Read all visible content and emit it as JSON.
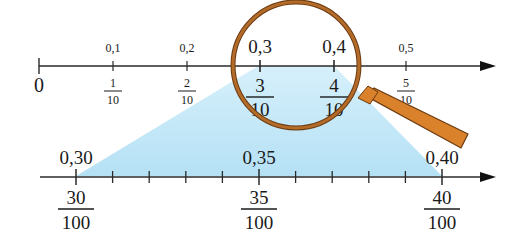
{
  "diagram": {
    "top_axis": {
      "zero_label": "0",
      "ticks": [
        {
          "decimal": "0,1",
          "num": "1",
          "den": "10"
        },
        {
          "decimal": "0,2",
          "num": "2",
          "den": "10"
        },
        {
          "decimal": "0,3",
          "num": "3",
          "den": "10"
        },
        {
          "decimal": "0,4",
          "num": "4",
          "den": "10"
        },
        {
          "decimal": "0,5",
          "num": "5",
          "den": "10"
        }
      ]
    },
    "bottom_axis": {
      "labeled_ticks": [
        {
          "decimal": "0,30",
          "num": "30",
          "den": "100"
        },
        {
          "decimal": "0,35",
          "num": "35",
          "den": "100"
        },
        {
          "decimal": "0,40",
          "num": "40",
          "den": "100"
        }
      ],
      "minor_tick_count": 8
    },
    "colors": {
      "axis": "#2a2a2a",
      "highlight": "#bfe6f7",
      "magnifier_rim": "#9a5a1e",
      "magnifier_handle": "#d9822b"
    }
  }
}
